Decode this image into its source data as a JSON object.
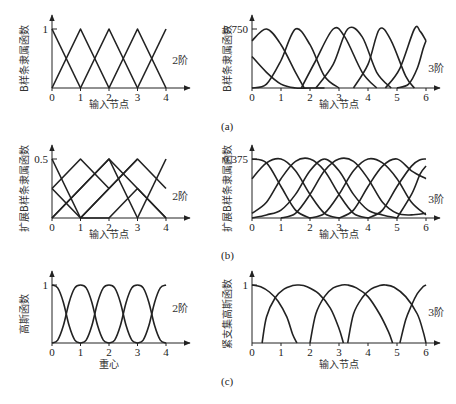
{
  "figure": {
    "captions": [
      "(a)",
      "(b)",
      "(c)"
    ]
  },
  "chart_data": [
    {
      "id": "a-left",
      "type": "line",
      "ylabel": "B样条隶属函数",
      "xlabel": "输入节点",
      "order_label": "2阶",
      "xticks": [
        "0",
        "1",
        "2",
        "3",
        "4"
      ],
      "ytick_label": "1",
      "xlim": [
        0,
        4
      ],
      "ylim": [
        0,
        1
      ],
      "series": [
        {
          "name": "b0",
          "x": [
            0,
            1
          ],
          "y": [
            1,
            0
          ]
        },
        {
          "name": "b1",
          "x": [
            0,
            1,
            2
          ],
          "y": [
            0,
            1,
            0
          ]
        },
        {
          "name": "b2",
          "x": [
            1,
            2,
            3
          ],
          "y": [
            0,
            1,
            0
          ]
        },
        {
          "name": "b3",
          "x": [
            2,
            3,
            4
          ],
          "y": [
            0,
            1,
            0
          ]
        },
        {
          "name": "b4",
          "x": [
            3,
            4
          ],
          "y": [
            0,
            1
          ]
        }
      ]
    },
    {
      "id": "a-right",
      "type": "line",
      "ylabel": "B样条隶属函数",
      "xlabel": "输入节点",
      "order_label": "3阶",
      "xticks": [
        "0",
        "1",
        "2",
        "3",
        "4",
        "5",
        "6"
      ],
      "ytick_label": "0.750",
      "xlim": [
        0,
        6
      ],
      "ylim": [
        0,
        0.75
      ],
      "series": [
        {
          "name": "c0",
          "x": [
            0,
            0.5,
            1,
            1.5,
            1.8
          ],
          "y": [
            0.6,
            0.75,
            0.55,
            0.2,
            0
          ]
        },
        {
          "name": "c1",
          "x": [
            0,
            0.5,
            1,
            1.5,
            2,
            2.5
          ],
          "y": [
            0.4,
            0.2,
            0.05,
            0,
            0,
            0
          ]
        },
        {
          "name": "c2",
          "x": [
            0,
            0.5,
            1,
            1.5,
            2,
            2.5,
            3
          ],
          "y": [
            0,
            0.05,
            0.35,
            0.75,
            0.55,
            0.15,
            0
          ]
        },
        {
          "name": "c3",
          "x": [
            1.7,
            2.2,
            2.8,
            3.2,
            3.8,
            4.3
          ],
          "y": [
            0,
            0.35,
            0.75,
            0.65,
            0.2,
            0
          ]
        },
        {
          "name": "c4",
          "x": [
            2.2,
            2.8,
            3.3,
            3.8,
            4.3,
            4.8
          ],
          "y": [
            0,
            0.3,
            0.75,
            0.65,
            0.2,
            0
          ]
        },
        {
          "name": "c5",
          "x": [
            3.5,
            4,
            4.4,
            4.8,
            5.3,
            5.6
          ],
          "y": [
            0,
            0.3,
            0.75,
            0.6,
            0.15,
            0
          ]
        },
        {
          "name": "c6",
          "x": [
            4.6,
            5.1,
            5.6,
            5.8,
            6
          ],
          "y": [
            0,
            0.25,
            0.75,
            0.72,
            0.6
          ]
        },
        {
          "name": "c7",
          "x": [
            5,
            5.4,
            5.7,
            5.9,
            6
          ],
          "y": [
            0,
            0.05,
            0.25,
            0.5,
            0.6
          ]
        }
      ]
    },
    {
      "id": "b-left",
      "type": "line",
      "ylabel": "扩展B样条隶属函数",
      "xlabel": "输入节点",
      "order_label": "2阶",
      "xticks": [
        "0",
        "1",
        "2",
        "3",
        "4"
      ],
      "ytick_label": "0.5",
      "xlim": [
        0,
        4
      ],
      "ylim": [
        0,
        0.5
      ],
      "series": [
        {
          "name": "e0",
          "x": [
            0,
            1,
            2
          ],
          "y": [
            0.5,
            0,
            0
          ]
        },
        {
          "name": "e1",
          "x": [
            0,
            1,
            2
          ],
          "y": [
            0.25,
            0.5,
            0.25
          ]
        },
        {
          "name": "e2",
          "x": [
            0,
            1,
            2,
            3
          ],
          "y": [
            0,
            0.25,
            0.5,
            0
          ]
        },
        {
          "name": "e3",
          "x": [
            0,
            1,
            2,
            3
          ],
          "y": [
            0.25,
            0,
            0.25,
            0.5
          ]
        },
        {
          "name": "e4",
          "x": [
            1,
            2,
            3,
            4
          ],
          "y": [
            0,
            0.25,
            0.5,
            0.25
          ]
        },
        {
          "name": "e5",
          "x": [
            2,
            3,
            4
          ],
          "y": [
            0,
            0.25,
            0
          ]
        },
        {
          "name": "e6",
          "x": [
            0,
            2,
            3,
            4
          ],
          "y": [
            0,
            0.5,
            0.25,
            0
          ]
        },
        {
          "name": "e7",
          "x": [
            3,
            4
          ],
          "y": [
            0,
            0.5
          ]
        }
      ]
    },
    {
      "id": "b-right",
      "type": "line",
      "ylabel": "扩展B样条隶属函数",
      "xlabel": "输入节点",
      "order_label": "3阶",
      "xticks": [
        "0",
        "1",
        "2",
        "3",
        "4",
        "5",
        "6"
      ],
      "ytick_label": "0.375",
      "xlim": [
        0,
        6
      ],
      "ylim": [
        0,
        0.375
      ],
      "series": [
        {
          "name": "f0",
          "x": [
            0,
            0.5,
            1,
            1.5,
            2
          ],
          "y": [
            0.375,
            0.35,
            0.2,
            0.05,
            0
          ]
        },
        {
          "name": "f1",
          "x": [
            0,
            0.5,
            1,
            1.5,
            2,
            2.5,
            3
          ],
          "y": [
            0.25,
            0.35,
            0.375,
            0.3,
            0.15,
            0.03,
            0
          ]
        },
        {
          "name": "f2",
          "x": [
            0,
            0.5,
            1,
            1.5,
            2,
            2.5,
            3,
            3.5,
            4
          ],
          "y": [
            0.03,
            0.1,
            0.25,
            0.36,
            0.375,
            0.3,
            0.15,
            0.03,
            0
          ]
        },
        {
          "name": "f3",
          "x": [
            0,
            0.5,
            1,
            1.5,
            2,
            2.5,
            3,
            3.5,
            4,
            4.5,
            5
          ],
          "y": [
            0,
            0.02,
            0.05,
            0.15,
            0.3,
            0.375,
            0.3,
            0.15,
            0.05,
            0.02,
            0
          ]
        },
        {
          "name": "f4",
          "x": [
            1,
            1.5,
            2,
            2.5,
            3,
            3.5,
            4,
            4.5,
            5,
            5.5,
            6
          ],
          "y": [
            0,
            0.03,
            0.15,
            0.3,
            0.375,
            0.36,
            0.25,
            0.1,
            0.03,
            0.02,
            0.03
          ]
        },
        {
          "name": "f5",
          "x": [
            2,
            2.5,
            3,
            3.5,
            4,
            4.5,
            5,
            5.5,
            6
          ],
          "y": [
            0,
            0.03,
            0.15,
            0.3,
            0.375,
            0.35,
            0.25,
            0.1,
            0.02
          ]
        },
        {
          "name": "f6",
          "x": [
            3,
            3.5,
            4,
            4.5,
            5,
            5.5,
            6
          ],
          "y": [
            0,
            0.05,
            0.2,
            0.33,
            0.375,
            0.3,
            0.25
          ]
        },
        {
          "name": "f7",
          "x": [
            4,
            4.5,
            5,
            5.5,
            5.8,
            6
          ],
          "y": [
            0,
            0.05,
            0.2,
            0.33,
            0.37,
            0.375
          ]
        },
        {
          "name": "f8",
          "x": [
            5,
            5.5,
            5.8,
            6
          ],
          "y": [
            0,
            0.15,
            0.28,
            0.33
          ]
        }
      ]
    },
    {
      "id": "c-left",
      "type": "line",
      "ylabel": "高斯函数",
      "xlabel": "重心",
      "order_label": "2阶",
      "xticks": [
        "0",
        "1",
        "2",
        "3",
        "4"
      ],
      "ytick_label": "1",
      "xlim": [
        0,
        4
      ],
      "ylim": [
        0,
        1
      ],
      "series": [
        {
          "name": "g0",
          "x": [
            0,
            0.2,
            0.4,
            0.6,
            0.8,
            1
          ],
          "y": [
            1,
            0.95,
            0.7,
            0.3,
            0.05,
            0
          ]
        },
        {
          "name": "g1",
          "x": [
            0,
            0.2,
            0.4,
            0.6,
            0.8,
            1,
            1.2,
            1.4,
            1.6,
            1.8,
            2
          ],
          "y": [
            0,
            0.05,
            0.3,
            0.7,
            0.95,
            1,
            0.95,
            0.7,
            0.3,
            0.05,
            0
          ]
        },
        {
          "name": "g2",
          "x": [
            1,
            1.2,
            1.4,
            1.6,
            1.8,
            2,
            2.2,
            2.4,
            2.6,
            2.8,
            3
          ],
          "y": [
            0,
            0.05,
            0.3,
            0.7,
            0.95,
            1,
            0.95,
            0.7,
            0.3,
            0.05,
            0
          ]
        },
        {
          "name": "g3",
          "x": [
            2,
            2.2,
            2.4,
            2.6,
            2.8,
            3,
            3.2,
            3.4,
            3.6,
            3.8,
            4
          ],
          "y": [
            0,
            0.05,
            0.3,
            0.7,
            0.95,
            1,
            0.95,
            0.7,
            0.3,
            0.05,
            0
          ]
        },
        {
          "name": "g4",
          "x": [
            3,
            3.2,
            3.4,
            3.6,
            3.8,
            4
          ],
          "y": [
            0,
            0.05,
            0.3,
            0.7,
            0.95,
            1
          ]
        }
      ]
    },
    {
      "id": "c-right",
      "type": "line",
      "ylabel": "紧支集高斯函数",
      "xlabel": "输入节点",
      "order_label": "3阶",
      "xticks": [
        "0",
        "1",
        "2",
        "3",
        "4",
        "5",
        "6"
      ],
      "ytick_label": "1",
      "xlim": [
        0,
        6
      ],
      "ylim": [
        0,
        1
      ],
      "series": [
        {
          "name": "h0",
          "x": [
            0,
            0.3,
            0.6,
            0.9,
            1.2,
            1.4,
            1.55
          ],
          "y": [
            1,
            0.97,
            0.88,
            0.72,
            0.45,
            0.15,
            0
          ]
        },
        {
          "name": "h1",
          "x": [
            0.35,
            0.5,
            0.8,
            1.1,
            1.4,
            1.6,
            1.9,
            2.3,
            2.7,
            3.0,
            3.15
          ],
          "y": [
            0,
            0.45,
            0.78,
            0.93,
            0.99,
            1,
            0.97,
            0.85,
            0.6,
            0.25,
            0
          ]
        },
        {
          "name": "h2",
          "x": [
            2,
            2.2,
            2.5,
            2.8,
            3.1,
            3.3,
            3.6,
            4.0,
            4.4,
            4.7,
            4.85
          ],
          "y": [
            0,
            0.5,
            0.8,
            0.95,
            1,
            1,
            0.95,
            0.8,
            0.5,
            0.2,
            0
          ]
        },
        {
          "name": "h3",
          "x": [
            3.3,
            3.5,
            3.8,
            4.1,
            4.4,
            4.6,
            4.9,
            5.3,
            5.7,
            5.9,
            6
          ],
          "y": [
            0,
            0.5,
            0.78,
            0.93,
            0.99,
            1,
            0.96,
            0.8,
            0.5,
            0.2,
            0
          ]
        },
        {
          "name": "h4",
          "x": [
            5.1,
            5.3,
            5.5,
            5.7,
            5.9,
            6
          ],
          "y": [
            0,
            0.4,
            0.65,
            0.85,
            0.97,
            1
          ]
        }
      ]
    }
  ]
}
